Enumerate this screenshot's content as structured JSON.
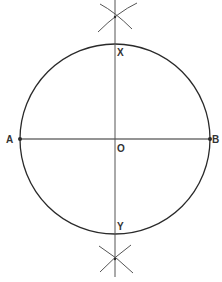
{
  "diagram": {
    "colors": {
      "stroke": "#2a2a2a",
      "construction": "#555555",
      "text": "#333333",
      "background": "#ffffff"
    },
    "circle": {
      "cx": 115,
      "cy": 139,
      "r": 95
    },
    "points": [
      {
        "id": "A",
        "label": "A",
        "x": 20,
        "y": 139
      },
      {
        "id": "B",
        "label": "B",
        "x": 210,
        "y": 139
      },
      {
        "id": "O",
        "label": "O",
        "x": 115,
        "y": 139
      },
      {
        "id": "X",
        "label": "X",
        "x": 115,
        "y": 44
      },
      {
        "id": "Y",
        "label": "Y",
        "x": 115,
        "y": 234
      }
    ],
    "labels": {
      "A": "A",
      "B": "B",
      "O": "O",
      "X": "X",
      "Y": "Y"
    },
    "lines": [
      {
        "name": "diameter-AB",
        "from": "A",
        "to": "B"
      },
      {
        "name": "perpendicular-bisector",
        "x": 115,
        "y1": 0,
        "y2": 277
      }
    ],
    "construction_arcs": [
      {
        "name": "upper-arc-crossing",
        "x": 115,
        "y": 17
      },
      {
        "name": "lower-arc-crossing",
        "x": 115,
        "y": 259
      }
    ]
  }
}
